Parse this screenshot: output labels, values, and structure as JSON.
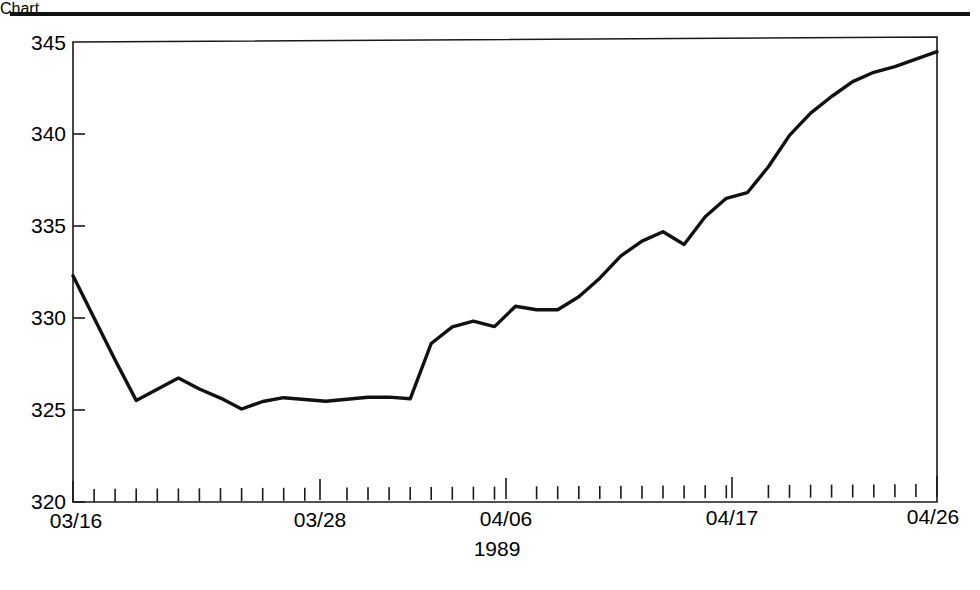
{
  "figure": {
    "top_rule": "horizontal-rule",
    "background_color": "#ffffff",
    "line_color": "#111111"
  },
  "chart_data": {
    "type": "line",
    "title": "",
    "subtitle": "",
    "xlabel": "1989",
    "ylabel": "",
    "xlim_labels": [
      "03/16",
      "04/26"
    ],
    "ylim": [
      320,
      345
    ],
    "grid": false,
    "legend": null,
    "legend_position": "none",
    "y_ticks": [
      320,
      325,
      330,
      335,
      340,
      345
    ],
    "y_tick_labels": [
      "320",
      "325",
      "330",
      "335",
      "340",
      "345"
    ],
    "x_major_ticks": [
      "03/16",
      "03/28",
      "04/06",
      "04/17",
      "04/26"
    ],
    "x_major_tick_indices": [
      0,
      12,
      21,
      32,
      41
    ],
    "x_minor_tick_count": 42,
    "x": [
      "03/16",
      "03/17",
      "03/18",
      "03/19",
      "03/20",
      "03/21",
      "03/22",
      "03/23",
      "03/24",
      "03/25",
      "03/26",
      "03/27",
      "03/28",
      "03/29",
      "03/30",
      "03/31",
      "04/01",
      "04/02",
      "04/03",
      "04/04",
      "04/05",
      "04/06",
      "04/07",
      "04/08",
      "04/09",
      "04/10",
      "04/11",
      "04/12",
      "04/13",
      "04/14",
      "04/15",
      "04/16",
      "04/17",
      "04/18",
      "04/19",
      "04/20",
      "04/21",
      "04/22",
      "04/23",
      "04/24",
      "04/25",
      "04/26"
    ],
    "values": [
      332.3,
      330.0,
      327.7,
      325.5,
      326.1,
      326.7,
      326.1,
      325.6,
      325.0,
      325.4,
      325.6,
      325.5,
      325.4,
      325.5,
      325.6,
      325.6,
      325.5,
      328.5,
      329.4,
      329.7,
      329.4,
      330.5,
      330.3,
      330.3,
      331.0,
      332.0,
      333.2,
      334.0,
      334.5,
      333.8,
      335.3,
      336.3,
      336.6,
      338.0,
      339.7,
      340.9,
      341.8,
      342.6,
      343.1,
      343.4,
      343.8,
      344.2
    ],
    "series": [
      {
        "name": "",
        "values": [
          332.3,
          330.0,
          327.7,
          325.5,
          326.1,
          326.7,
          326.1,
          325.6,
          325.0,
          325.4,
          325.6,
          325.5,
          325.4,
          325.5,
          325.6,
          325.6,
          325.5,
          328.5,
          329.4,
          329.7,
          329.4,
          330.5,
          330.3,
          330.3,
          331.0,
          332.0,
          333.2,
          334.0,
          334.5,
          333.8,
          335.3,
          336.3,
          336.6,
          338.0,
          339.7,
          340.9,
          341.8,
          342.6,
          343.1,
          343.4,
          343.8,
          344.2
        ]
      }
    ]
  },
  "axes": {
    "x_axis_caption": "1989",
    "y_tick_labels": [
      "345",
      "340",
      "335",
      "330",
      "325",
      "320"
    ],
    "x_tick_labels": [
      "03/16",
      "03/28",
      "04/06",
      "04/17",
      "04/26"
    ]
  }
}
